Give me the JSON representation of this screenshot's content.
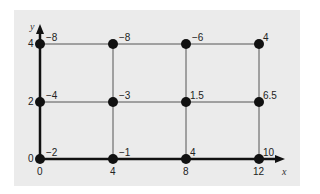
{
  "diagram": {
    "axes": {
      "x_label": "x",
      "y_label": "y",
      "x_ticks": [
        "0",
        "4",
        "8",
        "12"
      ],
      "y_ticks": [
        "0",
        "2",
        "4"
      ]
    },
    "points": [
      {
        "x": 0,
        "y": 4,
        "value": "−8"
      },
      {
        "x": 4,
        "y": 4,
        "value": "−8"
      },
      {
        "x": 8,
        "y": 4,
        "value": "−6"
      },
      {
        "x": 12,
        "y": 4,
        "value": "4"
      },
      {
        "x": 0,
        "y": 2,
        "value": "−4"
      },
      {
        "x": 4,
        "y": 2,
        "value": "−3"
      },
      {
        "x": 8,
        "y": 2,
        "value": "1.5"
      },
      {
        "x": 12,
        "y": 2,
        "value": "6.5"
      },
      {
        "x": 0,
        "y": 0,
        "value": "−2"
      },
      {
        "x": 4,
        "y": 0,
        "value": "−1"
      },
      {
        "x": 8,
        "y": 0,
        "value": "4"
      },
      {
        "x": 12,
        "y": 0,
        "value": "10"
      }
    ],
    "colors": {
      "panel": "#ebebeb",
      "grid_line": "#555555",
      "axis": "#111111",
      "point": "#111111"
    }
  }
}
